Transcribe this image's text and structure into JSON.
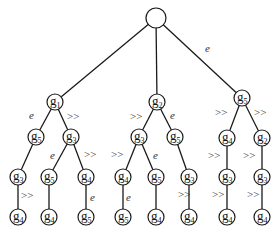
{
  "diagram": {
    "type": "tree",
    "root": {
      "id": "root",
      "label": "",
      "x": 156,
      "y": 18,
      "r": 10
    },
    "nodes": [
      {
        "id": "n1",
        "base": "g",
        "sub": "1",
        "x": 55,
        "y": 102
      },
      {
        "id": "n2",
        "base": "g",
        "sub": "2",
        "x": 157,
        "y": 102
      },
      {
        "id": "n3",
        "base": "g",
        "sub": "5",
        "x": 242,
        "y": 98
      },
      {
        "id": "n4",
        "base": "g",
        "sub": "5",
        "x": 36,
        "y": 137
      },
      {
        "id": "n5",
        "base": "g",
        "sub": "3",
        "x": 71,
        "y": 137
      },
      {
        "id": "n6",
        "base": "g",
        "sub": "3",
        "x": 139,
        "y": 137
      },
      {
        "id": "n7",
        "base": "g",
        "sub": "5",
        "x": 175,
        "y": 137
      },
      {
        "id": "n8",
        "base": "g",
        "sub": "4",
        "x": 227,
        "y": 138
      },
      {
        "id": "n9",
        "base": "g",
        "sub": "2",
        "x": 262,
        "y": 138
      },
      {
        "id": "n10",
        "base": "g",
        "sub": "3",
        "x": 18,
        "y": 177
      },
      {
        "id": "n11",
        "base": "g",
        "sub": "5",
        "x": 49,
        "y": 177
      },
      {
        "id": "n12",
        "base": "g",
        "sub": "4",
        "x": 86,
        "y": 177
      },
      {
        "id": "n13",
        "base": "g",
        "sub": "4",
        "x": 123,
        "y": 177
      },
      {
        "id": "n14",
        "base": "g",
        "sub": "5",
        "x": 156,
        "y": 177
      },
      {
        "id": "n15",
        "base": "g",
        "sub": "3",
        "x": 189,
        "y": 177
      },
      {
        "id": "n16",
        "base": "g",
        "sub": "3",
        "x": 227,
        "y": 177
      },
      {
        "id": "n17",
        "base": "g",
        "sub": "3",
        "x": 262,
        "y": 177
      },
      {
        "id": "n18",
        "base": "g",
        "sub": "4",
        "x": 18,
        "y": 217
      },
      {
        "id": "n19",
        "base": "g",
        "sub": "4",
        "x": 49,
        "y": 217
      },
      {
        "id": "n20",
        "base": "g",
        "sub": "5",
        "x": 86,
        "y": 217
      },
      {
        "id": "n21",
        "base": "g",
        "sub": "5",
        "x": 123,
        "y": 217
      },
      {
        "id": "n22",
        "base": "g",
        "sub": "4",
        "x": 156,
        "y": 217
      },
      {
        "id": "n23",
        "base": "g",
        "sub": "4",
        "x": 189,
        "y": 217
      },
      {
        "id": "n24",
        "base": "g",
        "sub": "4",
        "x": 227,
        "y": 217
      },
      {
        "id": "n25",
        "base": "g",
        "sub": "4",
        "x": 262,
        "y": 217
      }
    ],
    "edges": [
      {
        "from": "root",
        "to": "n1",
        "label": ""
      },
      {
        "from": "root",
        "to": "n2",
        "label": ""
      },
      {
        "from": "root",
        "to": "n3",
        "label": "e",
        "lx": 205,
        "ly": 52
      },
      {
        "from": "n1",
        "to": "n4",
        "label": "e",
        "lx": 29,
        "ly": 119
      },
      {
        "from": "n1",
        "to": "n5",
        "label": ">>",
        "lx": 67,
        "ly": 120
      },
      {
        "from": "n2",
        "to": "n6",
        "label": ">>",
        "lx": 130,
        "ly": 120
      },
      {
        "from": "n2",
        "to": "n7",
        "label": "e",
        "lx": 170,
        "ly": 119
      },
      {
        "from": "n3",
        "to": "n8",
        "label": ">>",
        "lx": 215,
        "ly": 116
      },
      {
        "from": "n3",
        "to": "n9",
        "label": ">>",
        "lx": 254,
        "ly": 116
      },
      {
        "from": "n4",
        "to": "n10",
        "label": ""
      },
      {
        "from": "n5",
        "to": "n11",
        "label": "e",
        "lx": 50,
        "ly": 159
      },
      {
        "from": "n5",
        "to": "n12",
        "label": ">>",
        "lx": 84,
        "ly": 158
      },
      {
        "from": "n6",
        "to": "n13",
        "label": ">>",
        "lx": 111,
        "ly": 158
      },
      {
        "from": "n6",
        "to": "n14",
        "label": "e",
        "lx": 153,
        "ly": 159
      },
      {
        "from": "n7",
        "to": "n15",
        "label": ""
      },
      {
        "from": "n8",
        "to": "n16",
        "label": ">>",
        "lx": 208,
        "ly": 159
      },
      {
        "from": "n9",
        "to": "n17",
        "label": ">>",
        "lx": 243,
        "ly": 159
      },
      {
        "from": "n10",
        "to": "n18",
        "label": ">>",
        "lx": 21,
        "ly": 199
      },
      {
        "from": "n11",
        "to": "n19",
        "label": ""
      },
      {
        "from": "n12",
        "to": "n20",
        "label": "e",
        "lx": 90,
        "ly": 201
      },
      {
        "from": "n13",
        "to": "n21",
        "label": "e",
        "lx": 126,
        "ly": 201
      },
      {
        "from": "n14",
        "to": "n22",
        "label": ""
      },
      {
        "from": "n15",
        "to": "n23",
        "label": ">>",
        "lx": 178,
        "ly": 198
      },
      {
        "from": "n16",
        "to": "n24",
        "label": ">>",
        "lx": 212,
        "ly": 198
      },
      {
        "from": "n17",
        "to": "n25",
        "label": ">>",
        "lx": 247,
        "ly": 198
      }
    ],
    "node_radius": 8,
    "colors": {
      "line": "#1a1a1a",
      "node_fill": "#ffffff",
      "text": "#111111",
      "edge_label": "#333333"
    }
  }
}
